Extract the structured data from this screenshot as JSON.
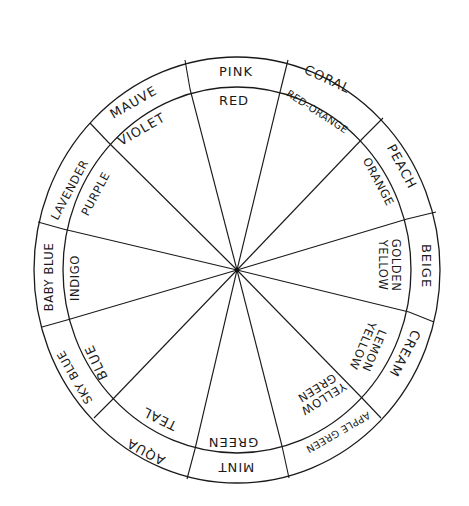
{
  "diagram": {
    "title": "",
    "center": {
      "x": 237,
      "y": 270
    },
    "outer_ring": {
      "rx": 203,
      "ry": 213
    },
    "inner_ring": {
      "rx": 174,
      "ry": 183
    },
    "stroke_color": "#1a1a1a",
    "background": "#ffffff",
    "boundaries": [
      {
        "name": "violet-red",
        "inner": [
          190,
          89
        ],
        "outer": [
          185,
          60
        ]
      },
      {
        "name": "red-redorange",
        "inner": [
          281,
          88
        ],
        "outer": [
          288,
          60
        ]
      },
      {
        "name": "redorange-orange",
        "inner": [
          364,
          137
        ],
        "outer": [
          383,
          118
        ]
      },
      {
        "name": "orange-goldenyellow",
        "inner": [
          407,
          219
        ],
        "outer": [
          436,
          212
        ]
      },
      {
        "name": "goldenyellow-lemon",
        "inner": [
          409,
          312
        ],
        "outer": [
          434,
          322
        ]
      },
      {
        "name": "lemon-yellowgreen",
        "inner": [
          362,
          398
        ],
        "outer": [
          381,
          418
        ]
      },
      {
        "name": "yellowgreen-green",
        "inner": [
          282,
          446
        ],
        "outer": [
          289,
          478
        ]
      },
      {
        "name": "green-teal",
        "inner": [
          195,
          449
        ],
        "outer": [
          187,
          479
        ]
      },
      {
        "name": "teal-blue",
        "inner": [
          113,
          399
        ],
        "outer": [
          94,
          418
        ]
      },
      {
        "name": "blue-indigo",
        "inner": [
          67,
          320
        ],
        "outer": [
          42,
          327
        ]
      },
      {
        "name": "indigo-purple",
        "inner": [
          63,
          229
        ],
        "outer": [
          38,
          222
        ]
      },
      {
        "name": "purple-violet",
        "inner": [
          108,
          142
        ],
        "outer": [
          90,
          123
        ]
      }
    ],
    "segments": [
      {
        "hue": "RED",
        "tint": "PINK",
        "hue_lines": [
          "RED"
        ],
        "hue_pos": [
          234,
          101
        ],
        "hue_rot": 0,
        "tint_pos": [
          236,
          72
        ],
        "tint_rot": 0,
        "hue_size": "",
        "tint_size": ""
      },
      {
        "hue": "RED-ORANGE",
        "tint": "CORAL",
        "hue_lines": [
          "RED-ORANGE"
        ],
        "hue_pos": [
          317,
          112
        ],
        "hue_rot": 33,
        "tint_pos": [
          327,
          80
        ],
        "tint_rot": 25,
        "hue_size": "small",
        "tint_size": ""
      },
      {
        "hue": "ORANGE",
        "tint": "PEACH",
        "hue_lines": [
          "ORANGE"
        ],
        "hue_pos": [
          378,
          182
        ],
        "hue_rot": 62,
        "tint_pos": [
          401,
          167
        ],
        "tint_rot": 62,
        "hue_size": "mid",
        "tint_size": ""
      },
      {
        "hue": "GOLDEN YELLOW",
        "tint": "BEIGE",
        "hue_lines": [
          "GOLDEN",
          "YELLOW"
        ],
        "hue_pos": [
          389,
          265
        ],
        "hue_rot": 90,
        "tint_pos": [
          425,
          266
        ],
        "tint_rot": 90,
        "hue_size": "mid",
        "tint_size": ""
      },
      {
        "hue": "LEMON YELLOW",
        "tint": "CREAM",
        "hue_lines": [
          "LEMON",
          "YELLOW"
        ],
        "hue_pos": [
          368,
          348
        ],
        "hue_rot": 113,
        "tint_pos": [
          404,
          353
        ],
        "tint_rot": 118,
        "hue_size": "mid",
        "tint_size": ""
      },
      {
        "hue": "YELLOW GREEN",
        "tint": "APPLE GREEN",
        "hue_lines": [
          "YELLOW",
          "GREEN"
        ],
        "hue_pos": [
          320,
          393
        ],
        "hue_rot": 148,
        "tint_pos": [
          338,
          432
        ],
        "tint_rot": 150,
        "hue_size": "mid",
        "tint_size": "small"
      },
      {
        "hue": "GREEN",
        "tint": "MINT",
        "hue_lines": [
          "GREEN"
        ],
        "hue_pos": [
          233,
          441
        ],
        "hue_rot": 180,
        "tint_pos": [
          236,
          466
        ],
        "tint_rot": 180,
        "hue_size": "",
        "tint_size": ""
      },
      {
        "hue": "TEAL",
        "tint": "AQUA",
        "hue_lines": [
          "TEAL"
        ],
        "hue_pos": [
          160,
          418
        ],
        "hue_rot": 206,
        "tint_pos": [
          146,
          451
        ],
        "tint_rot": 208,
        "hue_size": "",
        "tint_size": ""
      },
      {
        "hue": "BLUE",
        "tint": "SKY BLUE",
        "hue_lines": [
          "BLUE"
        ],
        "hue_pos": [
          97,
          362
        ],
        "hue_rot": 245,
        "tint_pos": [
          75,
          377
        ],
        "tint_rot": 240,
        "hue_size": "",
        "tint_size": "mid"
      },
      {
        "hue": "INDIGO",
        "tint": "BABY BLUE",
        "hue_lines": [
          "INDIGO"
        ],
        "hue_pos": [
          75,
          278
        ],
        "hue_rot": -90,
        "tint_pos": [
          49,
          277
        ],
        "tint_rot": -90,
        "hue_size": "mid",
        "tint_size": "mid"
      },
      {
        "hue": "PURPLE",
        "tint": "LAVENDER",
        "hue_lines": [
          "PURPLE"
        ],
        "hue_pos": [
          96,
          194
        ],
        "hue_rot": -62,
        "tint_pos": [
          70,
          190
        ],
        "tint_rot": -62,
        "hue_size": "mid",
        "tint_size": "mid"
      },
      {
        "hue": "VIOLET",
        "tint": "MAUVE",
        "hue_lines": [
          "VIOLET"
        ],
        "hue_pos": [
          142,
          130
        ],
        "hue_rot": -30,
        "tint_pos": [
          134,
          103
        ],
        "tint_rot": -30,
        "hue_size": "",
        "tint_size": ""
      }
    ]
  }
}
